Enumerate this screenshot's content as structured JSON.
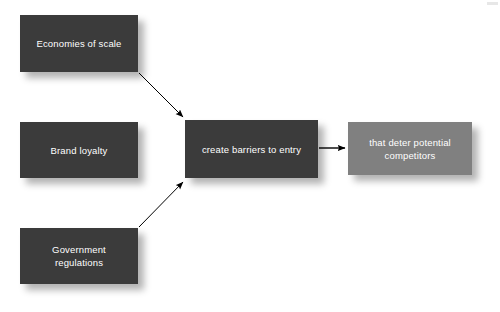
{
  "diagram": {
    "background_color": "#ffffff",
    "colors": {
      "node_dark": "#3b3b3b",
      "node_mid": "#808080",
      "node_text": "#ffffff",
      "arrow": "#000000",
      "shadow": "rgba(0,0,0,0.30)"
    },
    "nodes": [
      {
        "id": "economies-of-scale",
        "label": "Economies of scale",
        "fill": "#3b3b3b",
        "x": 20,
        "y": 15,
        "width": 118,
        "height": 57
      },
      {
        "id": "brand-loyalty",
        "label": "Brand loyalty",
        "fill": "#3b3b3b",
        "x": 20,
        "y": 122,
        "width": 118,
        "height": 56
      },
      {
        "id": "government-regulations",
        "label": "Government\nregulations",
        "fill": "#3b3b3b",
        "x": 20,
        "y": 228,
        "width": 118,
        "height": 56
      },
      {
        "id": "create-barriers-to-entry",
        "label": "create barriers to entry",
        "fill": "#3b3b3b",
        "x": 185,
        "y": 120,
        "width": 133,
        "height": 58
      },
      {
        "id": "that-deter-potential-competitors",
        "label": "that deter potential\ncompetitors",
        "fill": "#808080",
        "x": 348,
        "y": 122,
        "width": 124,
        "height": 53
      }
    ],
    "edges": [
      {
        "id": "edge-economies-to-barriers",
        "from": "economies-of-scale",
        "to": "create-barriers-to-entry",
        "x1": 139,
        "y1": 73,
        "x2": 186,
        "y2": 120,
        "style": "solid-arrow"
      },
      {
        "id": "edge-government-to-barriers",
        "from": "government-regulations",
        "to": "create-barriers-to-entry",
        "x1": 139,
        "y1": 227,
        "x2": 186,
        "y2": 179,
        "style": "solid-arrow"
      },
      {
        "id": "edge-barriers-to-deter",
        "from": "create-barriers-to-entry",
        "to": "that-deter-potential-competitors",
        "x1": 319,
        "y1": 148,
        "x2": 347,
        "y2": 148,
        "style": "solid-arrow"
      }
    ]
  }
}
